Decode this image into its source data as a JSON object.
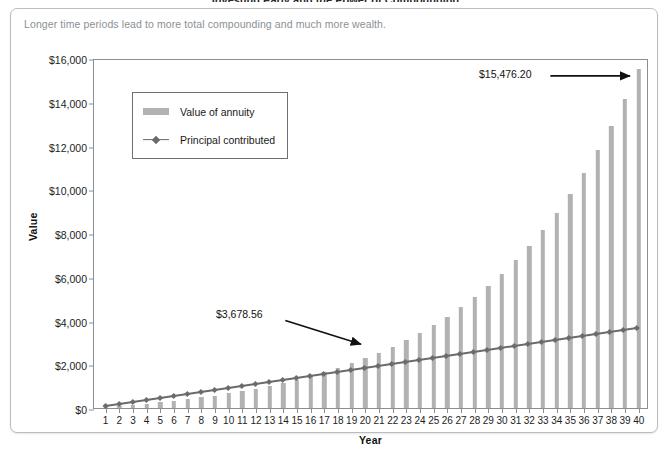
{
  "title_cut": "Investing Early and the Power of Compounding",
  "subtitle": "Longer time periods lead to more total compounding and much more wealth.",
  "legend": {
    "series_1": "Value of annuity",
    "series_2": "Principal contributed"
  },
  "annotations": [
    {
      "label": "$3,678.56",
      "year": 20
    },
    {
      "label": "$15,476.20",
      "year": 40
    }
  ],
  "axis": {
    "y_title": "Value",
    "x_title": "Year",
    "y_ticks": [
      "$0",
      "$2,000",
      "$4,000",
      "$6,000",
      "$8,000",
      "$10,000",
      "$12,000",
      "$14,000",
      "$16,000"
    ]
  },
  "colors": {
    "bar": "#b2b2b2",
    "line": "#6b6b6b",
    "axis": "#8a8f94",
    "subtitle": "#8c9094",
    "card_border": "#b9bdc1"
  },
  "chart_data": {
    "type": "bar",
    "title": "Investing Early and the Power of Compounding",
    "subtitle": "Longer time periods lead to more total compounding and much more wealth.",
    "xlabel": "Year",
    "ylabel": "Value",
    "ylim": [
      0,
      16000
    ],
    "ytick_values": [
      0,
      2000,
      4000,
      6000,
      8000,
      10000,
      12000,
      14000,
      16000
    ],
    "grid": false,
    "legend_position": "upper-left-inside",
    "categories": [
      1,
      2,
      3,
      4,
      5,
      6,
      7,
      8,
      9,
      10,
      11,
      12,
      13,
      14,
      15,
      16,
      17,
      18,
      19,
      20,
      21,
      22,
      23,
      24,
      25,
      26,
      27,
      28,
      29,
      30,
      31,
      32,
      33,
      34,
      35,
      36,
      37,
      38,
      39,
      40
    ],
    "series": [
      {
        "name": "Value of annuity",
        "type": "bar",
        "values": [
          183.93,
          383.2,
          599.18,
          833.33,
          1087.28,
          1362.83,
          1661.93,
          1986.73,
          2339.57,
          2723.0,
          3139.82,
          3593.08,
          4086.12,
          4622.59,
          5206.48,
          5842.15,
          6534.39,
          7288.46,
          8110.14,
          9005.83,
          9982.59,
          11048.21,
          12211.31,
          13481.39,
          14868.99,
          15476.2,
          15476.2,
          15476.2,
          15476.2,
          15476.2,
          15476.2,
          15476.2,
          15476.2,
          15476.2,
          15476.2,
          15476.2,
          15476.2,
          15476.2,
          15476.2,
          15476.2
        ],
        "values_display": [
          183.93,
          383.2,
          599.18,
          833.33,
          1087.28,
          1362.83,
          1661.93,
          1986.73,
          2339.57,
          2723.0,
          3139.82,
          3593.08,
          4086.12,
          4622.59,
          5206.48,
          5842.15,
          6534.39,
          7288.46,
          8110.14,
          9005.83,
          9982.59,
          11048.21,
          12211.31,
          13481.39,
          14868.99,
          15476.2
        ],
        "endpoint_label": "$15,476.20"
      },
      {
        "name": "Principal contributed",
        "type": "line",
        "marker": "diamond",
        "values": [
          91.96,
          183.93,
          275.89,
          367.86,
          459.82,
          551.78,
          643.75,
          735.71,
          827.68,
          919.64,
          1011.6,
          1103.57,
          1195.53,
          1287.5,
          1379.46,
          1471.42,
          1563.39,
          1655.35,
          1747.32,
          1839.28,
          1931.24,
          2023.21,
          2115.17,
          2207.14,
          2299.1,
          2391.06,
          2483.03,
          2574.99,
          2666.96,
          2758.92,
          2850.88,
          2942.85,
          3034.81,
          3126.78,
          3218.74,
          3310.7,
          3402.67,
          3494.63,
          3586.6,
          3678.56
        ],
        "midpoint_label": "$3,678.56"
      }
    ]
  }
}
